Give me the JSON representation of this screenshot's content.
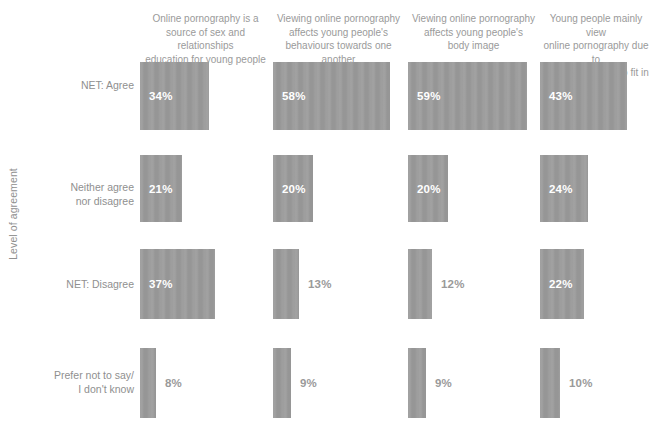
{
  "axis": {
    "y_title": "Level of agreement"
  },
  "chart_data": {
    "type": "bar",
    "orientation": "horizontal",
    "title": "",
    "subtitle": "",
    "xlabel": "",
    "ylabel": "Level of agreement",
    "grid": false,
    "legend": "none",
    "value_suffix": "%",
    "xlim": [
      0,
      60
    ],
    "columns": [
      "Online pornography is a source of sex and relationships education for young people",
      "Viewing online pornography affects young people's behaviours towards one another",
      "Viewing online pornography affects young people's body image",
      "Young people mainly view online pornography due to peer pressure or to fit in"
    ],
    "categories": [
      "NET: Agree",
      "Neither agree nor disagree",
      "NET: Disagree",
      "Prefer not to say/ I don't know"
    ],
    "series": [
      {
        "name": "Online pornography is a source of sex and relationships education for young people",
        "values": [
          34,
          21,
          37,
          8
        ],
        "labels": [
          "34%",
          "21%",
          "37%",
          "8%"
        ]
      },
      {
        "name": "Viewing online pornography affects young people's behaviours towards one another",
        "values": [
          58,
          20,
          13,
          9
        ],
        "labels": [
          "58%",
          "20%",
          "13%",
          "9%"
        ]
      },
      {
        "name": "Viewing online pornography affects young people's body image",
        "values": [
          59,
          20,
          12,
          9
        ],
        "labels": [
          "59%",
          "20%",
          "12%",
          "9%"
        ]
      },
      {
        "name": "Young people mainly view online pornography due to peer pressure or to fit in",
        "values": [
          43,
          24,
          22,
          10
        ],
        "labels": [
          "43%",
          "24%",
          "22%",
          "10%"
        ]
      }
    ],
    "colors": {
      "bar": "#9a9a9a",
      "label_inside": "#ffffff",
      "label_outside": "#9a9a9a",
      "text": "#8f8f8f",
      "background": "#ffffff"
    }
  },
  "headers": [
    {
      "lines": [
        "Online pornography is a",
        "source of sex and relationships",
        "education for young people"
      ]
    },
    {
      "lines": [
        "Viewing online pornography",
        "affects young people's",
        "behaviours towards one another"
      ]
    },
    {
      "lines": [
        "Viewing online pornography",
        "affects young people's",
        "body image"
      ]
    },
    {
      "lines": [
        "Young people mainly view",
        "online pornography due to",
        "peer pressure or to fit in"
      ]
    }
  ],
  "rows": [
    {
      "lines": [
        "NET: Agree"
      ]
    },
    {
      "lines": [
        "Neither agree",
        "nor disagree"
      ]
    },
    {
      "lines": [
        "NET: Disagree"
      ]
    },
    {
      "lines": [
        "Prefer not to say/",
        "I don't know"
      ]
    }
  ]
}
